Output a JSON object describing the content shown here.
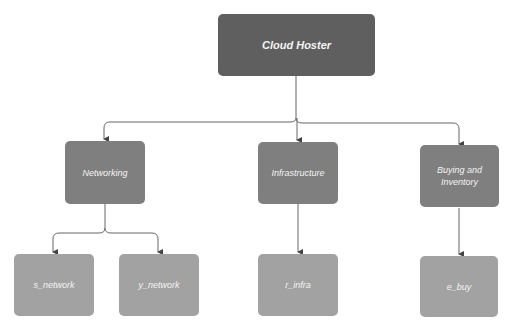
{
  "diagram": {
    "root": {
      "label": "Cloud Hoster"
    },
    "children": [
      {
        "label": "Networking",
        "children": [
          {
            "label": "s_network"
          },
          {
            "label": "y_network"
          }
        ]
      },
      {
        "label": "Infrastructure",
        "children": [
          {
            "label": "r_infra"
          }
        ]
      },
      {
        "label": "Buying and Inventory",
        "children": [
          {
            "label": "e_buy"
          }
        ]
      }
    ]
  },
  "colors": {
    "root": "#5f5f5f",
    "mid": "#7f7f7f",
    "leaf": "#a2a2a2",
    "connector": "#555555"
  }
}
